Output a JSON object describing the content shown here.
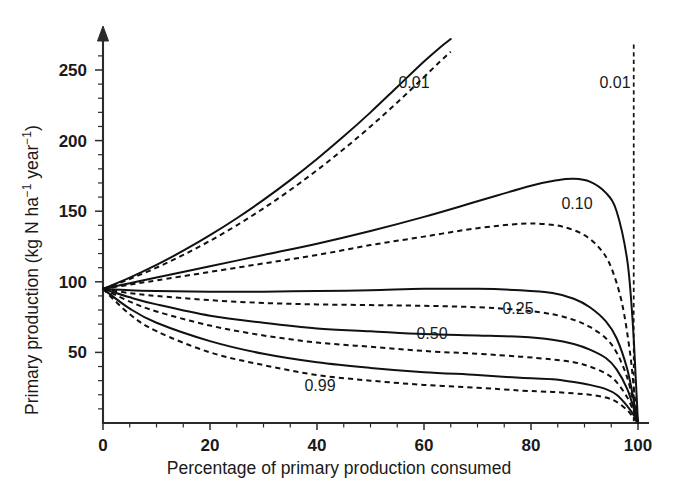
{
  "figure": {
    "name": "primary-production-vs-consumption",
    "background": "#ffffff",
    "ink_color": "#111111"
  },
  "axes": {
    "x_title": "Percentage of primary production consumed",
    "y_title_plain": "Primary production (kg N ha⁻¹ year⁻¹)",
    "y_title_parts": {
      "lead": "Primary production (kg N ha",
      "sup1": "−1",
      "mid": " year",
      "sup2": "−1",
      "tail": ")"
    },
    "x_ticks": [
      "0",
      "20",
      "40",
      "60",
      "80",
      "100"
    ],
    "y_ticks": [
      "50",
      "100",
      "150",
      "200",
      "250"
    ]
  },
  "curve_labels": [
    {
      "text": "0.01",
      "x_px": 414,
      "y_px": 88
    },
    {
      "text": "0.01",
      "x_px": 615,
      "y_px": 88
    },
    {
      "text": "0.10",
      "x_px": 577,
      "y_px": 209
    },
    {
      "text": "0.25",
      "x_px": 518,
      "y_px": 314
    },
    {
      "text": "0.50",
      "x_px": 432,
      "y_px": 339
    },
    {
      "text": "0.99",
      "x_px": 320,
      "y_px": 391
    }
  ],
  "chart_data": {
    "type": "line",
    "title": "",
    "xlabel": "Percentage of primary production consumed",
    "ylabel": "Primary production (kg N ha⁻¹ year⁻¹)",
    "xlim": [
      0,
      100
    ],
    "ylim": [
      0,
      265
    ],
    "xticks": [
      0,
      20,
      40,
      60,
      80,
      100
    ],
    "yticks": [
      50,
      100,
      150,
      200,
      250
    ],
    "x_minor_tick_step": 5,
    "y_minor_tick_step": 10,
    "grid": false,
    "legend": "inline-curve-labels",
    "annotations": [
      {
        "label": "0.01",
        "note": "steep rising pair, exits top of plot near x=65"
      },
      {
        "label": "0.01",
        "note": "near-vertical dashed drop at x≈99, right of plot"
      },
      {
        "label": "0.10",
        "note": "solid peaks ≈173 at x≈88; dashed peaks ≈141 at x≈82"
      },
      {
        "label": "0.25",
        "note": "broad plateau ≈90–95"
      },
      {
        "label": "0.50",
        "note": "declining to ≈55–65 plateau"
      },
      {
        "label": "0.99",
        "note": "lowest pair, declining to ≈20–30"
      }
    ],
    "common_origin": {
      "x": 0,
      "y": 95
    },
    "common_endpoint": {
      "x": 100,
      "y": 0
    },
    "series": [
      {
        "name": "0.01 solid",
        "style": "solid",
        "x": [
          0,
          5,
          10,
          15,
          20,
          25,
          30,
          35,
          40,
          45,
          50,
          55,
          60,
          63,
          65
        ],
        "y": [
          95,
          103,
          112,
          122,
          133,
          145,
          158,
          172,
          187,
          203,
          220,
          238,
          256,
          266,
          272
        ]
      },
      {
        "name": "0.01 dashed",
        "style": "dashed",
        "x": [
          0,
          5,
          10,
          15,
          20,
          25,
          30,
          35,
          40,
          45,
          50,
          55,
          60,
          63,
          65
        ],
        "y": [
          95,
          102,
          110,
          119,
          129,
          140,
          152,
          165,
          179,
          194,
          210,
          227,
          245,
          256,
          263
        ]
      },
      {
        "name": "0.10 solid",
        "style": "solid",
        "x": [
          0,
          5,
          10,
          20,
          30,
          40,
          50,
          60,
          70,
          80,
          85,
          88,
          91,
          94,
          96,
          98,
          99,
          99.6,
          100
        ],
        "y": [
          95,
          99,
          103,
          111,
          119,
          127,
          136,
          146,
          157,
          168,
          172,
          173,
          171,
          163,
          150,
          115,
          72,
          30,
          0
        ]
      },
      {
        "name": "0.10 dashed",
        "style": "dashed",
        "x": [
          0,
          5,
          10,
          20,
          30,
          40,
          50,
          60,
          70,
          78,
          82,
          86,
          90,
          93,
          95,
          97,
          98.5,
          99.4,
          100
        ],
        "y": [
          95,
          98,
          101,
          107,
          113,
          119,
          126,
          132,
          138,
          141,
          141,
          139,
          133,
          123,
          110,
          85,
          50,
          18,
          0
        ]
      },
      {
        "name": "0.25 solid",
        "style": "solid",
        "x": [
          0,
          5,
          10,
          20,
          30,
          40,
          50,
          60,
          70,
          78,
          84,
          88,
          91,
          94,
          96,
          98,
          99.3,
          100
        ],
        "y": [
          95,
          94,
          93.5,
          93,
          93,
          93.5,
          94,
          95,
          95,
          94,
          92,
          88,
          82,
          72,
          60,
          38,
          14,
          0
        ]
      },
      {
        "name": "0.25 dashed",
        "style": "dashed",
        "x": [
          0,
          5,
          10,
          20,
          30,
          40,
          50,
          60,
          70,
          78,
          84,
          88,
          91,
          94,
          96,
          98,
          99.3,
          100
        ],
        "y": [
          95,
          92,
          90,
          87,
          85,
          84,
          83.5,
          83,
          82,
          80,
          77,
          73,
          68,
          60,
          50,
          32,
          12,
          0
        ]
      },
      {
        "name": "0.50 solid",
        "style": "solid",
        "x": [
          0,
          5,
          10,
          20,
          30,
          40,
          50,
          60,
          70,
          78,
          84,
          88,
          91,
          94,
          96,
          98,
          99.3,
          100
        ],
        "y": [
          95,
          89,
          84,
          76,
          71,
          67,
          65,
          63,
          62,
          61,
          59,
          56,
          52,
          46,
          38,
          24,
          9,
          0
        ]
      },
      {
        "name": "0.50 dashed",
        "style": "dashed",
        "x": [
          0,
          5,
          10,
          20,
          30,
          40,
          50,
          60,
          70,
          78,
          84,
          88,
          91,
          94,
          96,
          98,
          99.3,
          100
        ],
        "y": [
          95,
          86,
          79,
          69,
          62,
          57,
          54,
          51,
          49,
          47,
          45,
          43,
          40,
          35,
          29,
          18,
          7,
          0
        ]
      },
      {
        "name": "0.99 solid",
        "style": "solid",
        "x": [
          0,
          5,
          10,
          20,
          30,
          40,
          50,
          60,
          70,
          78,
          84,
          88,
          91,
          94,
          96,
          98,
          99.3,
          100
        ],
        "y": [
          95,
          81,
          71,
          58,
          49,
          43,
          39,
          36,
          34,
          32,
          31,
          29,
          27,
          24,
          20,
          12,
          5,
          0
        ]
      },
      {
        "name": "0.99 dashed",
        "style": "dashed",
        "x": [
          0,
          5,
          10,
          20,
          30,
          40,
          50,
          60,
          70,
          78,
          84,
          88,
          91,
          94,
          96,
          98,
          99.3,
          100
        ],
        "y": [
          95,
          77,
          65,
          50,
          41,
          34,
          30,
          27,
          25,
          23,
          22,
          21,
          20,
          18,
          15,
          9,
          3,
          0
        ]
      },
      {
        "name": "0.01 vertical dashed drop",
        "style": "vline-dashed",
        "x": [
          99.2,
          99.2
        ],
        "y": [
          268,
          0
        ]
      }
    ]
  }
}
